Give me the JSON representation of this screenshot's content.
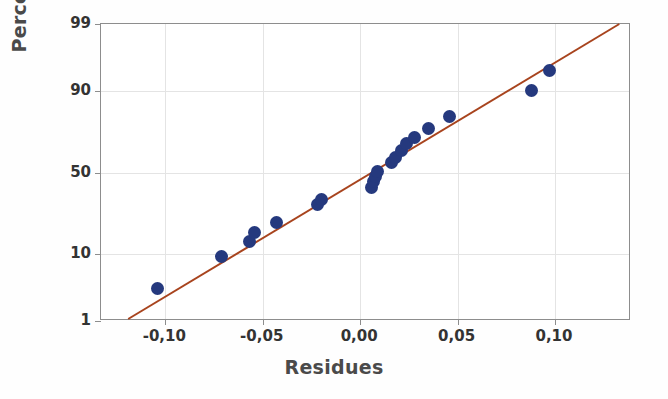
{
  "chart_data": {
    "type": "scatter",
    "title": "",
    "xlabel": "Residues",
    "ylabel": "Percent",
    "grid": true,
    "legend": false,
    "y_scale": "normal-probability",
    "xlim": [
      -0.133,
      0.139
    ],
    "ylim": [
      1,
      99
    ],
    "xticks": [
      "-0,10",
      "-0,05",
      "0,00",
      "0,05",
      "0,10"
    ],
    "xtick_values": [
      -0.1,
      -0.05,
      0.0,
      0.05,
      0.1
    ],
    "yticks": [
      "99",
      "90",
      "50",
      "10",
      "1"
    ],
    "ytick_values": [
      99,
      90,
      50,
      10,
      1
    ],
    "series": [
      {
        "name": "Residues",
        "marker": "circle",
        "color": "#25397e",
        "points": [
          {
            "x": -0.104,
            "y": 3.5
          },
          {
            "x": -0.071,
            "y": 9.3
          },
          {
            "x": -0.057,
            "y": 14.0
          },
          {
            "x": -0.054,
            "y": 17.5
          },
          {
            "x": -0.043,
            "y": 21.5
          },
          {
            "x": -0.022,
            "y": 31.0
          },
          {
            "x": -0.02,
            "y": 33.5
          },
          {
            "x": 0.006,
            "y": 41.0
          },
          {
            "x": 0.007,
            "y": 44.5
          },
          {
            "x": 0.008,
            "y": 47.5
          },
          {
            "x": 0.009,
            "y": 50.5
          },
          {
            "x": 0.016,
            "y": 56.5
          },
          {
            "x": 0.018,
            "y": 59.5
          },
          {
            "x": 0.021,
            "y": 63.5
          },
          {
            "x": 0.024,
            "y": 67.5
          },
          {
            "x": 0.028,
            "y": 71.0
          },
          {
            "x": 0.035,
            "y": 75.5
          },
          {
            "x": 0.046,
            "y": 81.0
          },
          {
            "x": 0.088,
            "y": 90.0
          },
          {
            "x": 0.097,
            "y": 94.5
          }
        ]
      }
    ],
    "fit_line": {
      "name": "reference-line",
      "color": "#a8441e",
      "start": {
        "x": -0.119,
        "y": 1.0
      },
      "end": {
        "x": 0.134,
        "y": 99.0
      }
    }
  }
}
